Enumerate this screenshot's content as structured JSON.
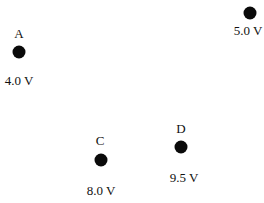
{
  "points": [
    {
      "name": "A",
      "voltage": "4.0 V"
    },
    {
      "name": "B",
      "voltage": "5.0 V"
    },
    {
      "name": "C",
      "voltage": "8.0 V"
    },
    {
      "name": "D",
      "voltage": "9.5 V"
    }
  ]
}
